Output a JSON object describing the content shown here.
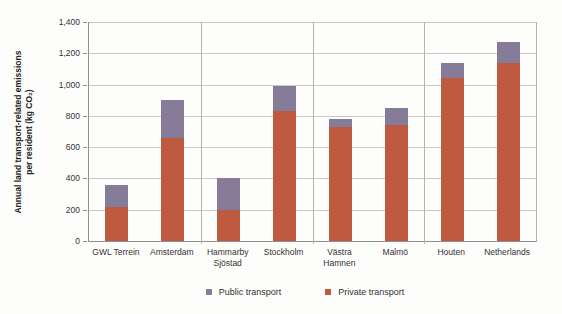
{
  "chart_data": {
    "type": "bar",
    "stacked": true,
    "title": "",
    "xlabel": "",
    "ylabel_line1": "Annual land transport-related emissions",
    "ylabel_line2": "per resident (kg CO₂)",
    "categories": [
      "GWL Terrein",
      "Amsterdam",
      "Hammarby Sjöstad",
      "Stockholm",
      "Västra Hamnen",
      "Malmö",
      "Houten",
      "Netherlands"
    ],
    "series": [
      {
        "name": "Private transport",
        "color": "#bd5a40",
        "values": [
          220,
          660,
          200,
          830,
          730,
          740,
          1040,
          1140
        ]
      },
      {
        "name": "Public transport",
        "color": "#867b98",
        "values": [
          140,
          240,
          200,
          160,
          50,
          110,
          100,
          130
        ]
      }
    ],
    "ylim": [
      0,
      1400
    ],
    "ytick_step": 200,
    "yticks": [
      "0",
      "200",
      "400",
      "600",
      "800",
      "1,000",
      "1,200",
      "1,400"
    ],
    "grid": true,
    "group_size": 2,
    "legend_position": "bottom",
    "legend": [
      {
        "label": "Public transport",
        "color": "#867b98"
      },
      {
        "label": "Private transport",
        "color": "#bd5a40"
      }
    ]
  }
}
